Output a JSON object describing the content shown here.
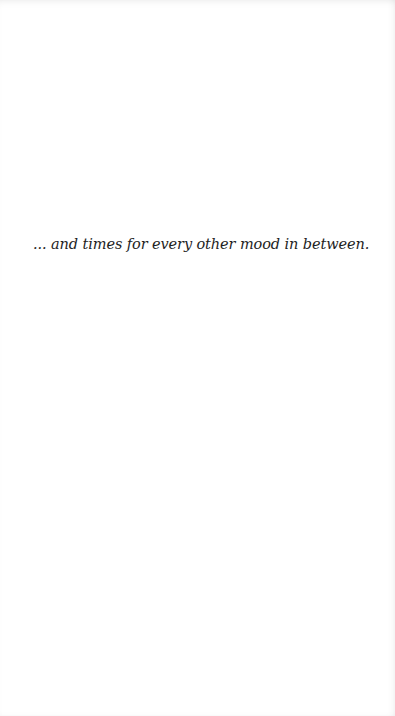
{
  "page": {
    "background_color": "#ffffff",
    "text_color": "#1e1e1e"
  },
  "content": {
    "quote": "... and times for every other mood in between."
  }
}
